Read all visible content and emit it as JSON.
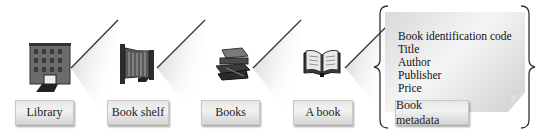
{
  "diagram": {
    "stages": [
      {
        "label": "Library",
        "icon": "library-building-icon"
      },
      {
        "label": "Book shelf",
        "icon": "bookshelf-icon"
      },
      {
        "label": "Books",
        "icon": "stack-of-books-icon"
      },
      {
        "label": "A book",
        "icon": "open-book-icon"
      },
      {
        "label": "Book metadata",
        "icon": "metadata-card-icon"
      }
    ],
    "metadata_fields": [
      "Book identification code",
      "Title",
      "Author",
      "Publisher",
      "Price",
      "..."
    ],
    "colors": {
      "wedge_line": "#333333",
      "wedge_fill": "#cfcfcf",
      "label_bg": "#e6e6e6",
      "card_bg": "#e3e3e3"
    }
  }
}
